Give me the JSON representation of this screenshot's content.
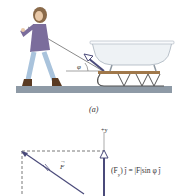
{
  "figure": {
    "panel_label": "(a)",
    "angle_label": "φ",
    "scene": {
      "person": "woman-pulling-rope",
      "object": "bathtub-on-sled",
      "ground": "gray-ground-strip"
    },
    "colors": {
      "ground": "#8e9aa6",
      "jacket": "#7b6d9c",
      "jeans": "#a9c3dc",
      "hair": "#8a6a4a",
      "tub": "#eef2f5",
      "sled_wood": "#a0784a",
      "vector": "#4a4a7a",
      "dashed": "#555555"
    }
  },
  "vector_diagram": {
    "axis_label": "+y",
    "force_label": "F",
    "component_formula": "(F",
    "component_subscript": "y",
    "component_formula_rest": ") ĵ = |F|sin φ ĵ"
  }
}
